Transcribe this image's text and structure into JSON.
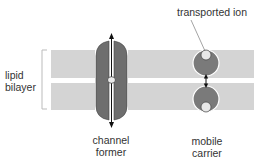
{
  "labels": {
    "lipid_bilayer_line1": "lipid",
    "lipid_bilayer_line2": "bilayer",
    "channel_former_line1": "channel",
    "channel_former_line2": "former",
    "mobile_carrier_line1": "mobile",
    "mobile_carrier_line2": "carrier",
    "transported_ion": "transported ion"
  },
  "colors": {
    "membrane": "#d4d4d4",
    "channel": "#6e6e6e",
    "carrier": "#7a7a7a",
    "ion": "#e8e8e8",
    "text": "#333333"
  }
}
